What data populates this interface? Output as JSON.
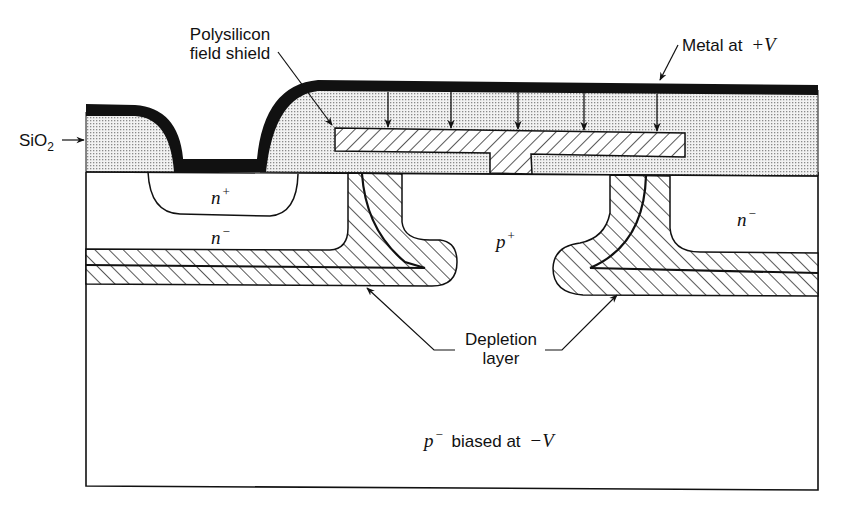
{
  "figure": {
    "type": "semiconductor cross-section",
    "colors": {
      "metal": "#111111",
      "oxide_fill": "#d9d9d9",
      "outline": "#111111",
      "background": "#ffffff"
    }
  },
  "labels": {
    "sio2": {
      "main": "SiO",
      "sub": "2"
    },
    "poly_shield": {
      "line1": "Polysilicon",
      "line2": "field shield"
    },
    "metal": {
      "text": "Metal at",
      "value": "+V"
    },
    "n_plus": {
      "sym": "n",
      "sup": "+"
    },
    "n_minus_left": {
      "sym": "n",
      "sup": "−"
    },
    "p_plus": {
      "sym": "p",
      "sup": "+"
    },
    "n_minus_right": {
      "sym": "n",
      "sup": "−"
    },
    "depletion": {
      "line1": "Depletion",
      "line2": "layer"
    },
    "substrate": {
      "sym": "p",
      "sup": "−",
      "text": "biased at",
      "value": "−V"
    }
  },
  "field_arrows": {
    "count": 5,
    "x_positions": [
      388,
      451,
      518,
      584,
      657
    ]
  }
}
